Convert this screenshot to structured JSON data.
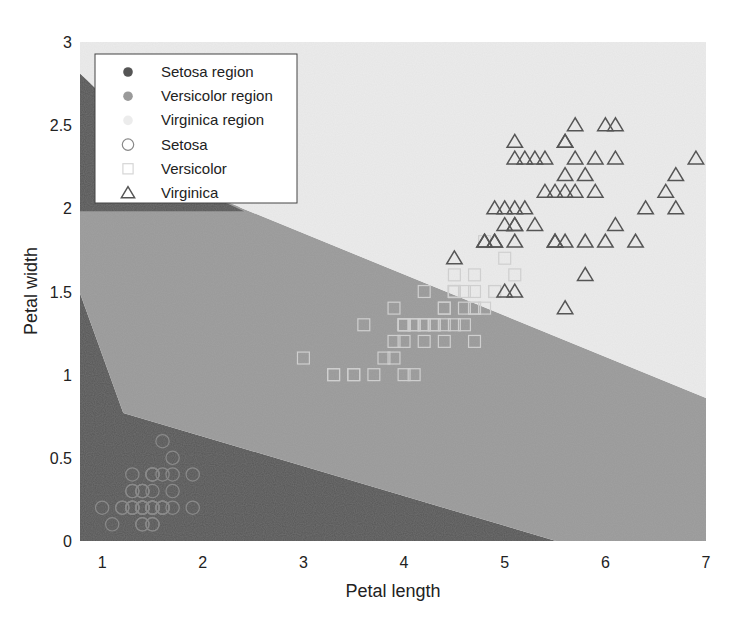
{
  "chart_data": {
    "type": "scatter",
    "title": "",
    "xlabel": "Petal length",
    "ylabel": "Petal width",
    "xlim": [
      0.78,
      7
    ],
    "ylim": [
      0,
      3
    ],
    "x_ticks": [
      1,
      2,
      3,
      4,
      5,
      6,
      7
    ],
    "y_ticks": [
      0,
      0.5,
      1,
      1.5,
      2,
      2.5,
      3
    ],
    "x_tick_labels": [
      "1",
      "2",
      "3",
      "4",
      "5",
      "6",
      "7"
    ],
    "y_tick_labels": [
      "0",
      "0.5",
      "1",
      "1.5",
      "2",
      "2.5",
      "3"
    ],
    "grid": false,
    "legend_position": "upper left",
    "colors": {
      "setosa_region": "#555555",
      "versicolor_region": "#9a9a9a",
      "virginica_region": "#ececec",
      "setosa_marker": "#8a8a8a",
      "versicolor_marker": "#cfcfcf",
      "virginica_marker": "#555555"
    },
    "regions": [
      {
        "name": "Setosa region",
        "polygons": [
          [
            [
              0.78,
              0
            ],
            [
              0.78,
              1.49
            ],
            [
              1.21,
              0.77
            ],
            [
              5.51,
              0
            ]
          ],
          [
            [
              0.78,
              2.81
            ],
            [
              0.78,
              1.98
            ],
            [
              2.42,
              1.98
            ]
          ]
        ]
      },
      {
        "name": "Versicolor region",
        "polygons": [
          [
            [
              0.78,
              1.49
            ],
            [
              0.78,
              1.98
            ],
            [
              2.42,
              1.98
            ],
            [
              1.99,
              2.1
            ],
            [
              7,
              0.86
            ],
            [
              7,
              0
            ],
            [
              5.51,
              0
            ],
            [
              1.21,
              0.77
            ]
          ]
        ]
      },
      {
        "name": "Virginica region",
        "polygons": [
          [
            [
              0.78,
              3
            ],
            [
              7,
              3
            ],
            [
              7,
              0.86
            ],
            [
              1.99,
              2.1
            ],
            [
              0.78,
              2.81
            ]
          ]
        ]
      }
    ],
    "legend": [
      {
        "label": "Setosa region",
        "marker": "filled-circle",
        "color_key": "setosa_region"
      },
      {
        "label": "Versicolor region",
        "marker": "filled-circle",
        "color_key": "versicolor_region"
      },
      {
        "label": "Virginica region",
        "marker": "filled-circle",
        "color_key": "virginica_region"
      },
      {
        "label": "Setosa",
        "marker": "circle",
        "color_key": "setosa_marker"
      },
      {
        "label": "Versicolor",
        "marker": "square",
        "color_key": "versicolor_marker"
      },
      {
        "label": "Virginica",
        "marker": "triangle",
        "color_key": "virginica_marker"
      }
    ],
    "series": [
      {
        "name": "Setosa",
        "marker": "circle",
        "points": [
          [
            1.4,
            0.2
          ],
          [
            1.4,
            0.2
          ],
          [
            1.3,
            0.2
          ],
          [
            1.5,
            0.2
          ],
          [
            1.4,
            0.2
          ],
          [
            1.7,
            0.4
          ],
          [
            1.4,
            0.3
          ],
          [
            1.5,
            0.2
          ],
          [
            1.4,
            0.2
          ],
          [
            1.5,
            0.1
          ],
          [
            1.5,
            0.2
          ],
          [
            1.6,
            0.2
          ],
          [
            1.4,
            0.1
          ],
          [
            1.1,
            0.1
          ],
          [
            1.2,
            0.2
          ],
          [
            1.5,
            0.4
          ],
          [
            1.3,
            0.4
          ],
          [
            1.4,
            0.3
          ],
          [
            1.7,
            0.3
          ],
          [
            1.5,
            0.3
          ],
          [
            1.7,
            0.2
          ],
          [
            1.5,
            0.4
          ],
          [
            1.0,
            0.2
          ],
          [
            1.7,
            0.5
          ],
          [
            1.9,
            0.2
          ],
          [
            1.6,
            0.2
          ],
          [
            1.6,
            0.4
          ],
          [
            1.5,
            0.2
          ],
          [
            1.4,
            0.2
          ],
          [
            1.6,
            0.2
          ],
          [
            1.6,
            0.2
          ],
          [
            1.5,
            0.4
          ],
          [
            1.5,
            0.1
          ],
          [
            1.4,
            0.2
          ],
          [
            1.5,
            0.2
          ],
          [
            1.2,
            0.2
          ],
          [
            1.3,
            0.2
          ],
          [
            1.4,
            0.1
          ],
          [
            1.3,
            0.2
          ],
          [
            1.5,
            0.2
          ],
          [
            1.3,
            0.3
          ],
          [
            1.3,
            0.3
          ],
          [
            1.3,
            0.2
          ],
          [
            1.6,
            0.6
          ],
          [
            1.9,
            0.4
          ],
          [
            1.4,
            0.3
          ],
          [
            1.6,
            0.2
          ],
          [
            1.4,
            0.2
          ],
          [
            1.5,
            0.2
          ],
          [
            1.4,
            0.2
          ]
        ]
      },
      {
        "name": "Versicolor",
        "marker": "square",
        "points": [
          [
            4.7,
            1.4
          ],
          [
            4.5,
            1.5
          ],
          [
            4.9,
            1.5
          ],
          [
            4.0,
            1.3
          ],
          [
            4.6,
            1.5
          ],
          [
            4.5,
            1.3
          ],
          [
            4.7,
            1.6
          ],
          [
            3.3,
            1.0
          ],
          [
            4.6,
            1.3
          ],
          [
            3.9,
            1.4
          ],
          [
            3.5,
            1.0
          ],
          [
            4.2,
            1.5
          ],
          [
            4.0,
            1.0
          ],
          [
            4.7,
            1.4
          ],
          [
            3.6,
            1.3
          ],
          [
            4.4,
            1.4
          ],
          [
            4.5,
            1.5
          ],
          [
            4.1,
            1.0
          ],
          [
            4.5,
            1.5
          ],
          [
            3.9,
            1.1
          ],
          [
            4.8,
            1.8
          ],
          [
            4.0,
            1.3
          ],
          [
            4.9,
            1.5
          ],
          [
            4.7,
            1.2
          ],
          [
            4.3,
            1.3
          ],
          [
            4.4,
            1.4
          ],
          [
            4.8,
            1.4
          ],
          [
            5.0,
            1.7
          ],
          [
            4.5,
            1.5
          ],
          [
            3.5,
            1.0
          ],
          [
            3.8,
            1.1
          ],
          [
            3.7,
            1.0
          ],
          [
            3.9,
            1.2
          ],
          [
            5.1,
            1.6
          ],
          [
            4.5,
            1.5
          ],
          [
            4.5,
            1.6
          ],
          [
            4.7,
            1.5
          ],
          [
            4.4,
            1.3
          ],
          [
            4.1,
            1.3
          ],
          [
            4.0,
            1.3
          ],
          [
            4.4,
            1.2
          ],
          [
            4.6,
            1.4
          ],
          [
            4.0,
            1.2
          ],
          [
            3.3,
            1.0
          ],
          [
            4.2,
            1.3
          ],
          [
            4.2,
            1.2
          ],
          [
            4.2,
            1.3
          ],
          [
            4.3,
            1.3
          ],
          [
            3.0,
            1.1
          ],
          [
            4.1,
            1.3
          ]
        ]
      },
      {
        "name": "Virginica",
        "marker": "triangle",
        "points": [
          [
            6.0,
            2.5
          ],
          [
            5.1,
            1.9
          ],
          [
            5.9,
            2.1
          ],
          [
            5.6,
            1.8
          ],
          [
            5.8,
            2.2
          ],
          [
            6.6,
            2.1
          ],
          [
            4.5,
            1.7
          ],
          [
            6.3,
            1.8
          ],
          [
            5.8,
            1.8
          ],
          [
            6.1,
            2.5
          ],
          [
            5.1,
            2.0
          ],
          [
            5.3,
            1.9
          ],
          [
            5.5,
            2.1
          ],
          [
            5.0,
            2.0
          ],
          [
            5.1,
            2.4
          ],
          [
            5.3,
            2.3
          ],
          [
            5.5,
            1.8
          ],
          [
            6.7,
            2.2
          ],
          [
            6.9,
            2.3
          ],
          [
            5.0,
            1.5
          ],
          [
            5.7,
            2.3
          ],
          [
            4.9,
            2.0
          ],
          [
            6.7,
            2.0
          ],
          [
            4.9,
            1.8
          ],
          [
            5.7,
            2.1
          ],
          [
            6.0,
            1.8
          ],
          [
            4.8,
            1.8
          ],
          [
            4.9,
            1.8
          ],
          [
            5.6,
            2.1
          ],
          [
            5.8,
            1.6
          ],
          [
            6.1,
            1.9
          ],
          [
            6.4,
            2.0
          ],
          [
            5.6,
            2.2
          ],
          [
            5.1,
            1.5
          ],
          [
            5.6,
            1.4
          ],
          [
            6.1,
            2.3
          ],
          [
            5.6,
            2.4
          ],
          [
            5.5,
            1.8
          ],
          [
            4.8,
            1.8
          ],
          [
            5.4,
            2.1
          ],
          [
            5.6,
            2.4
          ],
          [
            5.1,
            2.3
          ],
          [
            5.1,
            1.9
          ],
          [
            5.9,
            2.3
          ],
          [
            5.7,
            2.5
          ],
          [
            5.2,
            2.3
          ],
          [
            5.0,
            1.9
          ],
          [
            5.2,
            2.0
          ],
          [
            5.4,
            2.3
          ],
          [
            5.1,
            1.8
          ]
        ]
      }
    ]
  },
  "axes": {
    "xlabel": "Petal length",
    "ylabel": "Petal width"
  }
}
